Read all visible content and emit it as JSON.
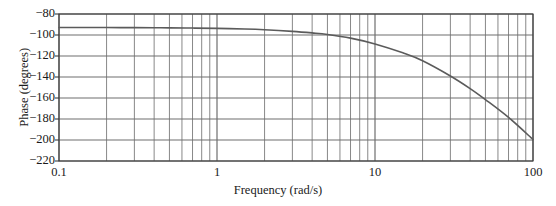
{
  "chart_data": {
    "type": "line",
    "title": "",
    "xlabel": "Frequency (rad/s)",
    "ylabel": "Phase (degrees)",
    "xscale": "log",
    "yscale": "linear",
    "xlim": [
      0.1,
      100
    ],
    "ylim": [
      -220,
      -80
    ],
    "grid": true,
    "grid_minor": true,
    "legend": "none",
    "xticks": [
      {
        "value": 0.1,
        "label": "0.1"
      },
      {
        "value": 1,
        "label": "1"
      },
      {
        "value": 10,
        "label": "10"
      },
      {
        "value": 100,
        "label": "100"
      }
    ],
    "yticks": [
      {
        "value": -80,
        "label": "−80"
      },
      {
        "value": -100,
        "label": "−100"
      },
      {
        "value": -120,
        "label": "−120"
      },
      {
        "value": -140,
        "label": "−140"
      },
      {
        "value": -160,
        "label": "−160"
      },
      {
        "value": -180,
        "label": "−180"
      },
      {
        "value": -200,
        "label": "−200"
      },
      {
        "value": -220,
        "label": "−220"
      }
    ],
    "series": [
      {
        "name": "phase",
        "color": "#5b5b5b",
        "x": [
          0.1,
          0.15,
          0.2,
          0.3,
          0.4,
          0.5,
          0.7,
          1.0,
          1.5,
          2.0,
          3.0,
          4.0,
          5.0,
          7.0,
          10.0,
          15.0,
          20.0,
          30.0,
          40.0,
          50.0,
          70.0,
          100.0
        ],
        "y": [
          -92.9,
          -92.9,
          -92.9,
          -93.0,
          -93.1,
          -93.2,
          -93.4,
          -93.7,
          -94.3,
          -95.0,
          -96.5,
          -98.0,
          -99.5,
          -103.0,
          -108.5,
          -117.0,
          -124.5,
          -139.0,
          -151.0,
          -161.5,
          -178.5,
          -199.5
        ]
      }
    ]
  },
  "axis": {
    "x_title": "Frequency (rad/s)",
    "y_title": "Phase (degrees)"
  },
  "colors": {
    "curve": "#5b5b5b",
    "grid_major": "#6e6e6e",
    "grid_minor": "#7a7a7a",
    "frame": "#3c3c3c",
    "text": "#1a1a1a",
    "background": "#ffffff"
  }
}
